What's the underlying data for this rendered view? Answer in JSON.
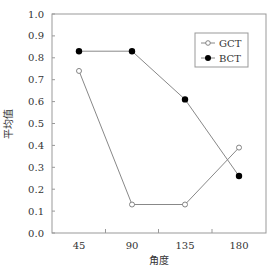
{
  "chart_data": {
    "type": "line",
    "title": "",
    "xlabel": "角度",
    "ylabel": "平均值",
    "categories": [
      "45",
      "90",
      "135",
      "180"
    ],
    "series": [
      {
        "name": "GCT",
        "marker": "open-circle",
        "values": [
          0.74,
          0.13,
          0.13,
          0.39
        ]
      },
      {
        "name": "BCT",
        "marker": "filled-circle",
        "values": [
          0.83,
          0.83,
          0.61,
          0.26
        ]
      }
    ],
    "ylim": [
      0.0,
      1.0
    ],
    "yticks": [
      "0.0",
      "0.1",
      "0.2",
      "0.3",
      "0.4",
      "0.5",
      "0.6",
      "0.7",
      "0.8",
      "0.9",
      "1.0"
    ],
    "grid": false,
    "legend_position": "upper right"
  },
  "colors": {
    "line": "#888888",
    "frame": "#999999",
    "marker_fill": "#000000",
    "open_marker_fill": "#ffffff"
  }
}
